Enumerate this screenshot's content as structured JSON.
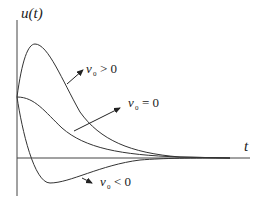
{
  "diagram": {
    "y_axis_label": "u(t)",
    "x_axis_label": "t",
    "curves": [
      {
        "name": "positive-initial-velocity",
        "label_var": "v",
        "label_sub": "0",
        "label_rel": "> 0"
      },
      {
        "name": "zero-initial-velocity",
        "label_var": "v",
        "label_sub": "0",
        "label_rel": "= 0"
      },
      {
        "name": "negative-initial-velocity",
        "label_var": "v",
        "label_sub": "0",
        "label_rel": "< 0"
      }
    ],
    "colors": {
      "line": "#333333",
      "background": "#ffffff"
    }
  }
}
